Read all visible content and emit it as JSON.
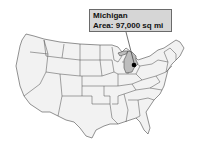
{
  "map": {
    "region": "United States",
    "highlighted_state": "Michigan",
    "highlight_color": "#bdbdbd",
    "state_fill": "#f2f2f2",
    "border_color": "#4a4a4a"
  },
  "callout": {
    "title": "Michigan",
    "detail": "Area: 97,000 sq mi",
    "background": "#d6d6d6"
  },
  "marker": {
    "icon": "location-dot-icon"
  }
}
